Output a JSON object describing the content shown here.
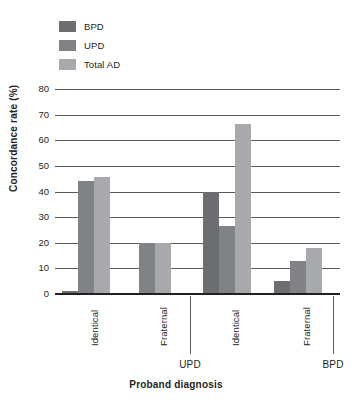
{
  "chart_data": {
    "type": "bar",
    "title": "",
    "xlabel": "Proband diagnosis",
    "ylabel": "Concordance rate (%)",
    "ylim": [
      0,
      80
    ],
    "yticks": [
      0,
      10,
      20,
      30,
      40,
      50,
      60,
      70,
      80
    ],
    "grid": true,
    "legend_position": "top-left",
    "categories": [
      "Identical",
      "Fraternal",
      "Identical",
      "Fraternal"
    ],
    "group_labels": [
      "UPD",
      "BPD"
    ],
    "groups": [
      {
        "proband": "UPD",
        "twin_type": "Identical"
      },
      {
        "proband": "UPD",
        "twin_type": "Fraternal"
      },
      {
        "proband": "BPD",
        "twin_type": "Identical"
      },
      {
        "proband": "BPD",
        "twin_type": "Fraternal"
      }
    ],
    "series": [
      {
        "name": "BPD",
        "color": "#6d6e71",
        "values": [
          1,
          null,
          40,
          5
        ]
      },
      {
        "name": "UPD",
        "color": "#808285",
        "values": [
          44,
          20,
          26.5,
          13
        ]
      },
      {
        "name": "Total AD",
        "color": "#a7a9ac",
        "values": [
          45.5,
          20,
          66.5,
          18
        ]
      }
    ]
  },
  "legend": {
    "items": [
      {
        "label": "BPD",
        "color": "#6d6e71",
        "icon": "legend-swatch-icon"
      },
      {
        "label": "UPD",
        "color": "#808285",
        "icon": "legend-swatch-icon"
      },
      {
        "label": "Total AD",
        "color": "#a7a9ac",
        "icon": "legend-swatch-icon"
      }
    ]
  },
  "axes": {
    "y_title": "Concordance rate (%)",
    "x_title": "Proband diagnosis",
    "y_ticks": [
      "0",
      "10",
      "20",
      "30",
      "40",
      "50",
      "60",
      "70",
      "80"
    ],
    "x_categories": [
      "Identical",
      "Fraternal",
      "Identical",
      "Fraternal"
    ],
    "x_groups": [
      "UPD",
      "BPD"
    ]
  },
  "colors": {
    "bpd": "#6d6e71",
    "upd": "#808285",
    "total_ad": "#a7a9ac",
    "axis": "#231f20",
    "grid": "#58585a",
    "background": "#ffffff"
  }
}
